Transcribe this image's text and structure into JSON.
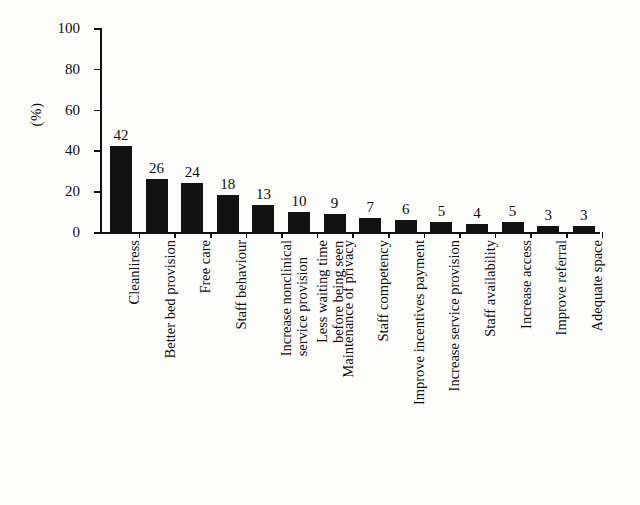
{
  "chart_data": {
    "type": "bar",
    "title": "",
    "subtitle": "",
    "xlabel": "",
    "ylabel": "(%)",
    "ylim": [
      0,
      100
    ],
    "yticks": [
      0,
      20,
      40,
      60,
      80,
      100
    ],
    "grid": false,
    "legend": false,
    "orientation": "vertical",
    "bar_color": "#121212",
    "categories": [
      "Cleanliress",
      "Better bed provision",
      "Free care",
      "Staff behaviour",
      "Increase nonclinical service provision",
      "Less waiting time before being seen",
      "Maintenance of privacy",
      "Staff competency",
      "Improve incentives payment",
      "Increase service provision",
      "Staff availability",
      "Increase access",
      "Improve referral",
      "Adequate space"
    ],
    "category_lines": [
      [
        "Cleanliress"
      ],
      [
        "Better bed provision"
      ],
      [
        "Free care"
      ],
      [
        "Staff behaviour"
      ],
      [
        "Increase nonclinical",
        "service provision"
      ],
      [
        "Less waiting time",
        "before being seen"
      ],
      [
        "Maintenance of privacy"
      ],
      [
        "Staff competency"
      ],
      [
        "Improve incentives payment"
      ],
      [
        "Increase service provision"
      ],
      [
        "Staff availability"
      ],
      [
        "Increase access"
      ],
      [
        "Improve referral"
      ],
      [
        "Adequate space"
      ]
    ],
    "values": [
      42,
      26,
      24,
      18,
      13,
      10,
      9,
      7,
      6,
      5,
      4,
      5,
      3,
      3
    ],
    "value_labels": [
      "42",
      "26",
      "24",
      "18",
      "13",
      "10",
      "9",
      "7",
      "6",
      "5",
      "4",
      "5",
      "3",
      "3"
    ]
  }
}
